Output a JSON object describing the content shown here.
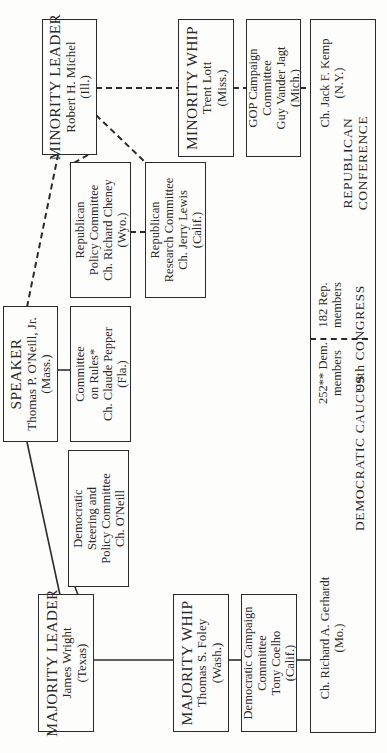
{
  "diagram": {
    "type": "organization-chart",
    "orientation": "rotated-90-ccw",
    "congress_label": "99th CONGRESS",
    "republican": {
      "minority_leader": {
        "title": "MINORITY LEADER",
        "name": "Robert H. Michel",
        "state": "(Ill.)"
      },
      "minority_whip": {
        "title": "MINORITY WHIP",
        "name": "Trent Lott",
        "state": "(Miss.)"
      },
      "campaign_committee": {
        "line1": "GOP Campaign",
        "line2": "Committee",
        "line3": "Guy Vander Jagt",
        "line4": "(Mich.)"
      },
      "policy_committee": {
        "line1": "Republican",
        "line2": "Policy Committee",
        "line3": "Ch. Richard Cheney",
        "line4": "(Wyo.)"
      },
      "research_committee": {
        "line1": "Republican",
        "line2": "Research Committee",
        "line3": "Ch. Jerry Lewis",
        "line4": "(Calif.)"
      },
      "conference": {
        "chair": "Ch. Jack F. Kemp",
        "chair_state": "(N.Y.)",
        "label_line1": "REPUBLICAN",
        "label_line2": "CONFERENCE",
        "members_line1": "182 Rep.",
        "members_line2": "members"
      }
    },
    "speaker": {
      "title": "SPEAKER",
      "name": "Thomas P. O'Neill, Jr.",
      "state": "(Mass.)"
    },
    "rules_committee": {
      "line1": "Committee",
      "line2": "on Rules*",
      "line3": "Ch. Claude Pepper",
      "line4": "(Fla.)"
    },
    "democratic": {
      "majority_leader": {
        "title": "MAJORITY LEADER",
        "name": "James Wright",
        "state": "(Texas)"
      },
      "majority_whip": {
        "title": "MAJORITY WHIP",
        "name": "Thomas S. Foley",
        "state": "(Wash.)"
      },
      "campaign_committee": {
        "line1": "Democratic Campaign",
        "line2": "Committee",
        "line3": "Tony Coelho",
        "line4": "(Calif.)"
      },
      "steering_committee": {
        "line1": "Democratic",
        "line2": "Steering and",
        "line3": "Policy Committee",
        "line4": "Ch. O'Neill"
      },
      "caucus": {
        "chair": "Ch. Richard A. Gerhardt",
        "chair_state": "(Mo.)",
        "label": "DEMOCRATIC CAUCUS",
        "members_line1": "252** Dem.",
        "members_line2": "members"
      }
    },
    "connector_styles": {
      "democratic": "solid",
      "republican": "dashed"
    },
    "colors": {
      "ink": "#2b2b2b",
      "paper": "#fdfdfb"
    }
  }
}
